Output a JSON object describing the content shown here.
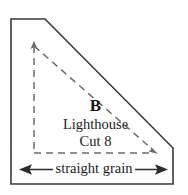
{
  "diagram": {
    "piece": {
      "letter": "B",
      "name": "Lighthouse",
      "cut_instruction": "Cut 8"
    },
    "grain": {
      "label": "straight grain",
      "left_arrow_icon": "arrow-left-icon",
      "right_arrow_icon": "arrow-right-icon"
    },
    "guides": {
      "vertical_dashed_icon": "dashed-vertical-guide-icon",
      "horizontal_dashed_icon": "dashed-horizontal-guide-icon",
      "diagonal_dashed_icon": "dashed-diagonal-guide-icon",
      "vertical_arrow_icon": "arrow-up-icon",
      "diagonal_arrow_icon": "arrow-down-right-icon"
    },
    "colors": {
      "outline": "#3a3a3a",
      "dashed_guide": "#6b6b6b",
      "text": "#1b1b1b",
      "background": "#ffffff"
    },
    "outline_shape": {
      "name": "chamfered-corner-template-outline",
      "points": "11,19 45,19 173,148 173,184 11,184"
    }
  }
}
